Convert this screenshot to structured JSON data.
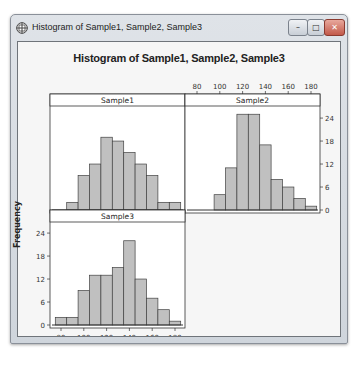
{
  "window": {
    "title": "Histogram of Sample1, Sample2, Sample3",
    "buttons": {
      "minimize": "–",
      "maximize": "□",
      "close": "✕"
    },
    "icon": "grid-plot-icon"
  },
  "chart_data": {
    "type": "bar",
    "title": "Histogram of Sample1, Sample2, Sample3",
    "xlabel": "",
    "ylabel": "Frequency",
    "ylim": [
      0,
      26
    ],
    "xlim": [
      73,
      187
    ],
    "x_ticks": [
      80,
      100,
      120,
      140,
      160,
      180
    ],
    "y_ticks": [
      0,
      6,
      12,
      18,
      24
    ],
    "bin_width": 10,
    "bin_starts": [
      75,
      85,
      95,
      105,
      115,
      125,
      135,
      145,
      155,
      165,
      175
    ],
    "grid": false,
    "legend": null,
    "panels": [
      {
        "name": "Sample1",
        "values": [
          2,
          9,
          12,
          19,
          18,
          15,
          12,
          9,
          2,
          2,
          0
        ],
        "bin_starts_note": "first bar starts at 85"
      },
      {
        "name": "Sample2",
        "values": [
          0,
          0,
          4,
          11,
          25,
          25,
          17,
          8,
          6,
          3,
          1
        ]
      },
      {
        "name": "Sample3",
        "values": [
          2,
          2,
          9,
          13,
          13,
          15,
          22,
          12,
          7,
          4,
          1
        ]
      }
    ],
    "series": [
      {
        "name": "Sample1",
        "categories": [
          85,
          95,
          105,
          115,
          125,
          135,
          145,
          155,
          165,
          175
        ],
        "values": [
          2,
          9,
          12,
          19,
          18,
          15,
          12,
          9,
          2,
          2
        ]
      },
      {
        "name": "Sample2",
        "categories": [
          95,
          105,
          115,
          125,
          135,
          145,
          155,
          165,
          175
        ],
        "values": [
          4,
          11,
          25,
          25,
          17,
          8,
          6,
          3,
          1
        ]
      },
      {
        "name": "Sample3",
        "categories": [
          75,
          85,
          95,
          105,
          115,
          125,
          135,
          145,
          155,
          165,
          175
        ],
        "values": [
          2,
          2,
          9,
          13,
          13,
          15,
          22,
          12,
          7,
          4,
          1
        ]
      }
    ],
    "colors": {
      "bar_fill": "#c0c0c0",
      "bar_edge": "#404040",
      "panel_bg": "#ffffff",
      "axis": "#333333"
    }
  }
}
